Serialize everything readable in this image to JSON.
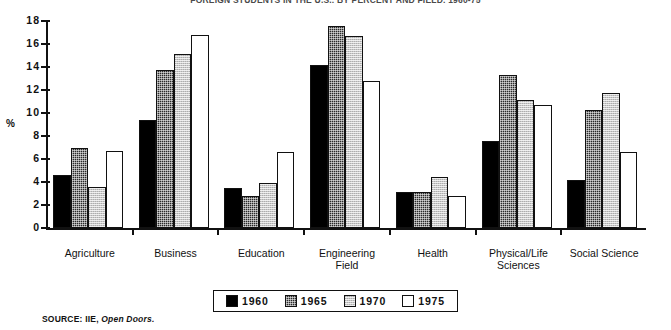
{
  "chart_data": {
    "type": "bar",
    "title": "FOREIGN STUDENTS IN THE U.S., BY PERCENT AND FIELD, 1960-75",
    "xlabel": "",
    "ylabel": "%",
    "ylim": [
      0,
      18
    ],
    "yticks": [
      "0",
      "2",
      "4",
      "6",
      "8",
      "10",
      "12",
      "14",
      "16",
      "18"
    ],
    "grid": false,
    "legend_position": "bottom",
    "categories": [
      "Agriculture",
      "Business",
      "Education",
      "Engineering Field",
      "Health",
      "Physical/Life Sciences",
      "Social Science"
    ],
    "series": [
      {
        "name": "1960",
        "fill": "solid-black",
        "color": "#000000",
        "values": [
          4.6,
          9.4,
          3.5,
          14.2,
          3.1,
          7.6,
          4.2
        ]
      },
      {
        "name": "1965",
        "fill": "dark-hatch",
        "color": "#2a2a2a",
        "values": [
          7.0,
          13.7,
          2.8,
          17.6,
          3.1,
          13.3,
          10.3
        ]
      },
      {
        "name": "1970",
        "fill": "light-hatch",
        "color": "#c9c9c9",
        "values": [
          3.6,
          15.1,
          3.9,
          16.7,
          4.4,
          11.1,
          11.7
        ]
      },
      {
        "name": "1975",
        "fill": "white",
        "color": "#ffffff",
        "values": [
          6.7,
          16.8,
          6.6,
          12.8,
          2.8,
          10.7,
          6.6
        ]
      }
    ],
    "source_note_prefix": "SOURCE: IIE, ",
    "source_note_italic": "Open Doors."
  }
}
